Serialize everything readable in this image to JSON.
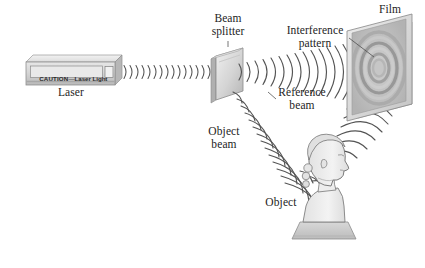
{
  "figure": {
    "background_color": "#ffffff",
    "line_color": "#4a4a4a",
    "text_color": "#1d1d1d"
  },
  "labels": {
    "laser": "Laser",
    "beam_splitter_line1": "Beam",
    "beam_splitter_line2": "splitter",
    "interference_line1": "Interference",
    "interference_line2": "pattern",
    "film": "Film",
    "reference_line1": "Reference",
    "reference_line2": "beam",
    "object_beam_line1": "Object",
    "object_beam_line2": "beam",
    "object": "Object"
  },
  "laser_device": {
    "warning_caution": "CAUTION",
    "warning_dash": "—",
    "warning_text": "Laser Light",
    "body_color": "#d8d8d8",
    "top_color": "#eaeaea",
    "side_color": "#bdbdbd",
    "aperture_color": "#f0f0f0"
  },
  "beam_splitter": {
    "plate_color": "#dcdcdc",
    "edge_color": "#9a9a9a"
  },
  "film_plate": {
    "plate_color": "#d2d2d2",
    "frame_color": "#e4e4e4",
    "ring_colors": [
      "#bdbdbd",
      "#9d9d9d",
      "#cfcfcf",
      "#8f8f8f",
      "#c4c4c4",
      "#a8a8a8"
    ]
  },
  "object_bust": {
    "face_color": "#efefef",
    "shade_color": "#d9d9d9",
    "pedestal_color": "#c9c9c9",
    "outline_color": "#6e6e6e"
  },
  "waves": {
    "laser_to_splitter_count": 16,
    "reference_beam_count": 14,
    "object_beam_count": 14,
    "scattered_beam_count": 13,
    "stroke_color": "#545454"
  }
}
